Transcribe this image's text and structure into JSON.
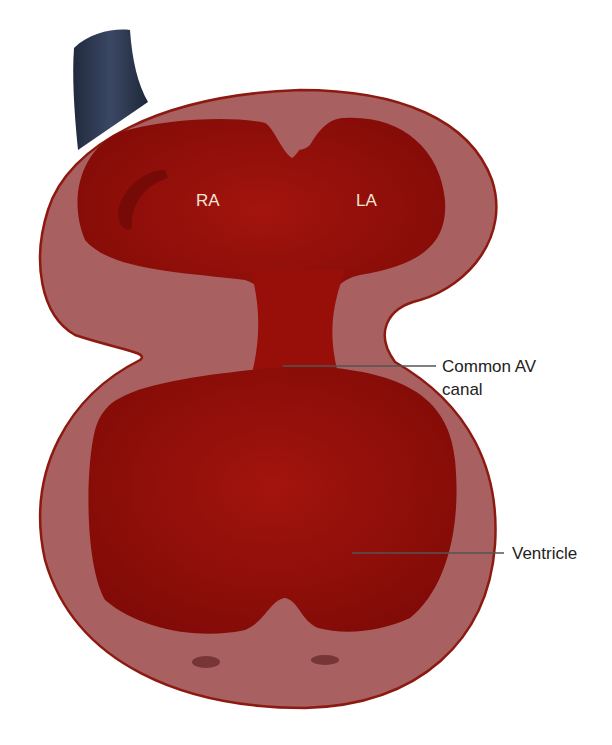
{
  "diagram": {
    "colors": {
      "wall": "#a86060",
      "wall_outline": "#8c1a10",
      "cavity": "#9a0f0a",
      "cavity_dark": "#7e0a06",
      "vessel": "#2e3a52",
      "leader_line": "#555555",
      "chamber_text": "#f3e6d6",
      "callout_text": "#222222"
    },
    "chamber_labels": {
      "ra": "RA",
      "la": "LA"
    },
    "callouts": {
      "av_canal_line1": "Common AV",
      "av_canal_line2": "canal",
      "ventricle": "Ventricle"
    }
  }
}
